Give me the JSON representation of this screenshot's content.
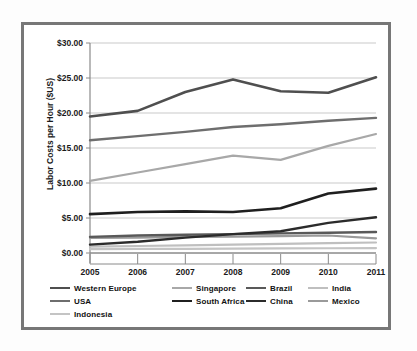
{
  "chart_data": {
    "type": "line",
    "title": "",
    "xlabel": "",
    "ylabel": "Labor Costs per Hour ($US)",
    "x": [
      "2005",
      "2006",
      "2007",
      "2008",
      "2009",
      "2010",
      "2011"
    ],
    "categories": [
      "2005",
      "2006",
      "2007",
      "2008",
      "2009",
      "2010",
      "2011"
    ],
    "ylim": [
      0,
      30
    ],
    "yticks": [
      0,
      5,
      10,
      15,
      20,
      25,
      30
    ],
    "ytick_labels": [
      "$0.00",
      "$5.00",
      "$10.00",
      "$15.00",
      "$20.00",
      "$25.00",
      "$30.00"
    ],
    "grid": true,
    "legend_position": "bottom",
    "series": [
      {
        "name": "Western Europe",
        "color": "#4f4f4f",
        "width": 2.6,
        "values": [
          19.5,
          20.3,
          23.0,
          24.8,
          23.1,
          22.9,
          25.1
        ]
      },
      {
        "name": "Singapore",
        "color": "#a8a8a8",
        "width": 2.2,
        "values": [
          10.3,
          11.5,
          12.7,
          13.9,
          13.3,
          15.3,
          17.0
        ]
      },
      {
        "name": "Brazil",
        "color": "#595959",
        "width": 2.4,
        "values": [
          2.3,
          2.5,
          2.6,
          2.7,
          2.8,
          2.9,
          3.0
        ]
      },
      {
        "name": "India",
        "color": "#bfbfbf",
        "width": 2.2,
        "values": [
          0.9,
          1.0,
          1.1,
          1.2,
          1.3,
          1.4,
          1.5
        ]
      },
      {
        "name": "USA",
        "color": "#6e6e6e",
        "width": 2.4,
        "values": [
          16.1,
          16.7,
          17.3,
          18.0,
          18.4,
          18.9,
          19.3
        ]
      },
      {
        "name": "South Africa",
        "color": "#1f1f1f",
        "width": 2.6,
        "values": [
          5.55,
          5.85,
          5.95,
          5.85,
          6.4,
          8.5,
          9.2
        ]
      },
      {
        "name": "China",
        "color": "#2b2b2b",
        "width": 2.4,
        "values": [
          1.2,
          1.6,
          2.2,
          2.7,
          3.1,
          4.3,
          5.1
        ]
      },
      {
        "name": "Mexico",
        "color": "#9a9a9a",
        "width": 2.2,
        "values": [
          2.15,
          2.2,
          2.3,
          2.35,
          2.4,
          2.5,
          2.1
        ]
      },
      {
        "name": "Indonesia",
        "color": "#c4c4c4",
        "width": 2.2,
        "values": [
          0.55,
          0.58,
          0.6,
          0.62,
          0.65,
          0.68,
          0.7
        ]
      }
    ]
  },
  "legend": {
    "rows": [
      [
        {
          "label": "Western Europe",
          "color": "#4f4f4f"
        },
        {
          "label": "Singapore",
          "color": "#a8a8a8"
        },
        {
          "label": "Brazil",
          "color": "#595959"
        },
        {
          "label": "India",
          "color": "#bfbfbf"
        }
      ],
      [
        {
          "label": "USA",
          "color": "#6e6e6e"
        },
        {
          "label": "South Africa",
          "color": "#1f1f1f"
        },
        {
          "label": "China",
          "color": "#2b2b2b"
        },
        {
          "label": "Mexico",
          "color": "#9a9a9a"
        }
      ],
      [
        {
          "label": "Indonesia",
          "color": "#c4c4c4"
        }
      ]
    ]
  },
  "style": {
    "frame_color": "#777777",
    "grid_color": "#c9c9c9",
    "axis_color": "#8a8a8a",
    "plot_background": "#ffffff",
    "page_background": "#fdfdfd",
    "text_color": "#1a1a1a"
  }
}
